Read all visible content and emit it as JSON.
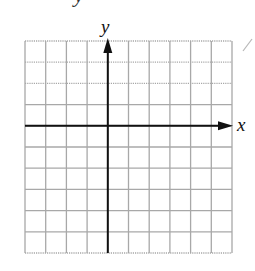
{
  "diagram": {
    "type": "coordinate-grid",
    "x_axis_label": "x",
    "y_axis_label": "y",
    "top_fragment_text": "y",
    "grid": {
      "columns": 10,
      "rows": 10,
      "left": 25,
      "top": 41,
      "right": 232,
      "bottom": 253,
      "origin_column": 4,
      "origin_row": 4
    },
    "colors": {
      "grid_line": "#a8a8a8",
      "axis": "#111111",
      "background": "#ffffff",
      "artifact": "#b8b8b8"
    }
  }
}
